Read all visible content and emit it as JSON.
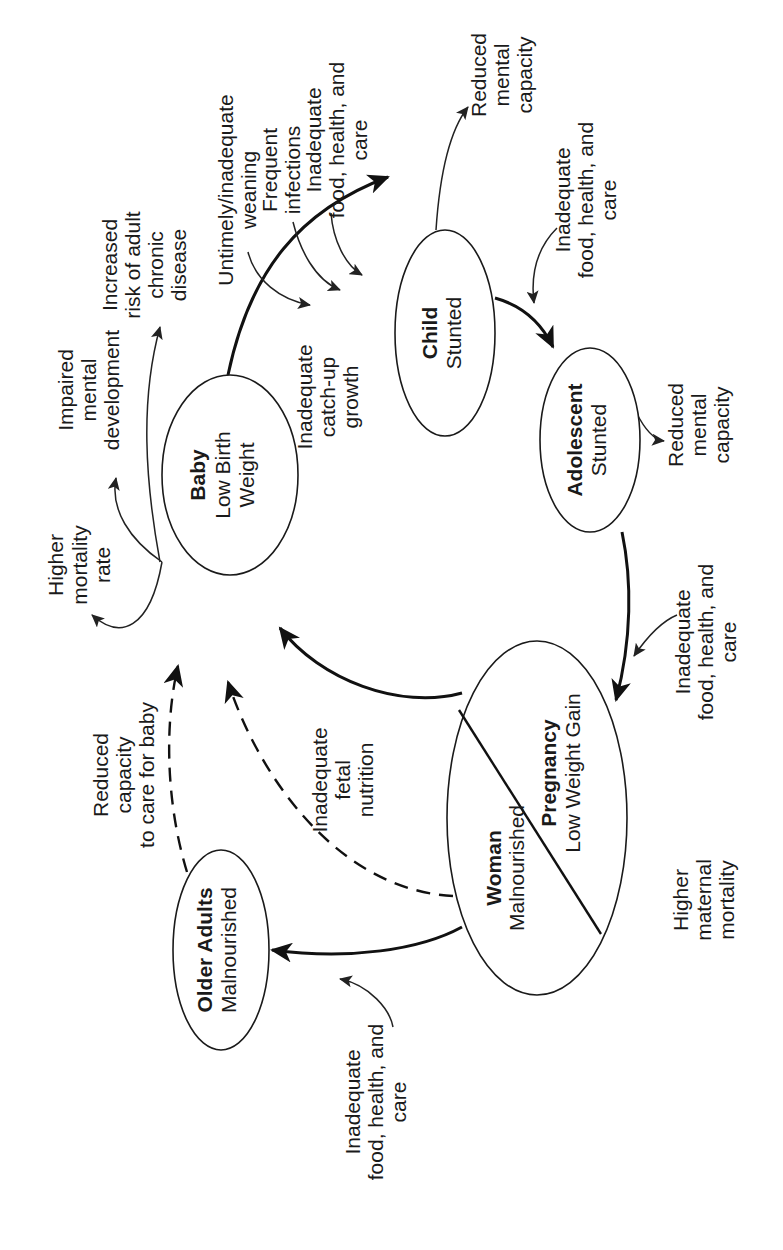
{
  "diagram": {
    "orientation": "rotated 90 degrees counter-clockwise",
    "nodes": {
      "baby": {
        "title": "Baby",
        "line1": "Low Birth",
        "line2": "Weight"
      },
      "child": {
        "title": "Child",
        "subtitle": "Stunted"
      },
      "adolescent": {
        "title": "Adolescent",
        "subtitle": "Stunted"
      },
      "woman": {
        "title": "Woman",
        "subtitle": "Malnourished"
      },
      "pregnancy": {
        "title": "Pregnancy",
        "subtitle": "Low Weight Gain"
      },
      "older_adults": {
        "title": "Older Adults",
        "subtitle": "Malnourished"
      }
    },
    "edge_labels": {
      "catch_up": [
        "Inadequate",
        "catch-up",
        "growth"
      ],
      "fetal": [
        "Inadequate",
        "fetal",
        "nutrition"
      ],
      "care_baby": [
        "Reduced",
        "capacity",
        "to care for baby"
      ]
    },
    "outcomes": {
      "baby_mortality": [
        "Higher",
        "mortality",
        "rate"
      ],
      "baby_mental": [
        "Impaired",
        "mental",
        "development"
      ],
      "baby_chronic": [
        "Increased",
        "risk of adult",
        "chronic",
        "disease"
      ],
      "child_mental": [
        "Reduced",
        "mental",
        "capacity"
      ],
      "adolescent_mental": [
        "Reduced",
        "mental",
        "capacity"
      ],
      "maternal_mortality": [
        "Higher",
        "maternal",
        "mortality"
      ]
    },
    "inputs": {
      "weaning": [
        "Untimely/inadequate",
        "weaning"
      ],
      "infections": [
        "Frequent",
        "infections"
      ],
      "child_food_top": [
        "Inadequate",
        "food, health, and",
        "care"
      ],
      "child_food": [
        "Inadequate",
        "food, health, and",
        "care"
      ],
      "adolescent_food": [
        "Inadequate",
        "food, health, and",
        "care"
      ],
      "older_food": [
        "Inadequate",
        "food, health, and",
        "care"
      ]
    }
  }
}
